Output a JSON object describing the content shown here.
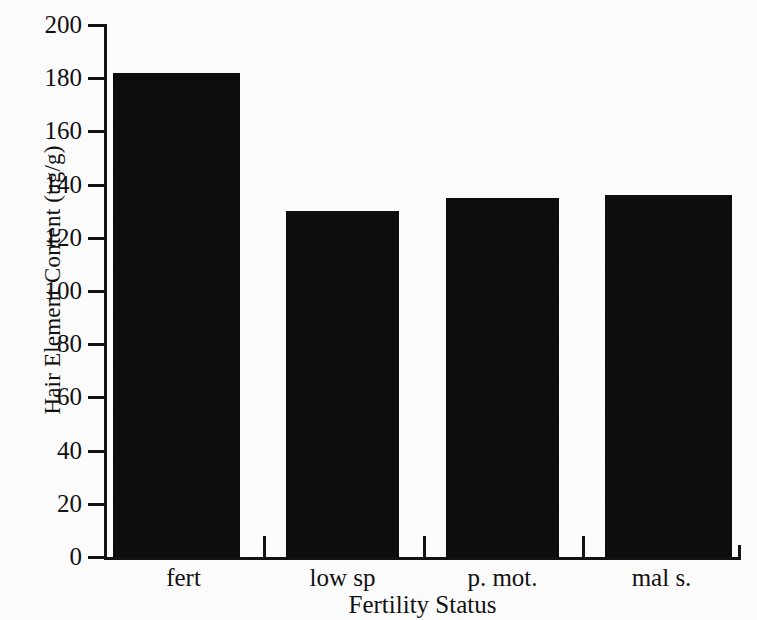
{
  "chart_data": {
    "type": "bar",
    "title": "",
    "subtitle": "",
    "xlabel": "Fertility Status",
    "ylabel": "Hair Element Content (ug/g)",
    "categories": [
      "fert",
      "low sp",
      "p. mot.",
      "mal s."
    ],
    "values": [
      182,
      130,
      135,
      136
    ],
    "series": [
      {
        "name": "Hair Element Content",
        "values": [
          182,
          130,
          135,
          136
        ]
      }
    ],
    "ylim": [
      0,
      200
    ],
    "y_ticks": [
      0,
      20,
      40,
      60,
      80,
      100,
      120,
      140,
      160,
      180,
      200
    ],
    "y_tick_labels": [
      "0",
      "20",
      "40",
      "60",
      "80",
      "100",
      "120",
      "140",
      "160",
      "180",
      "200"
    ],
    "grid": false,
    "legend": false,
    "legend_position": "none",
    "bar_color": "#0d0d0d",
    "background_color": "#fbfbfb",
    "axis_color": "#131313"
  },
  "axes": {
    "y_title": "Hair Element Content (ug/g)",
    "x_title": "Fertility Status"
  }
}
